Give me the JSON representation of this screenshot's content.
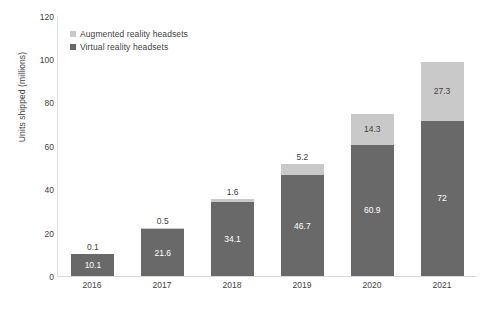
{
  "chart_data": {
    "type": "bar",
    "subtype": "stacked-column",
    "title": "",
    "subtitle": "",
    "xlabel": "",
    "ylabel": "Units shipped (millions)",
    "categories": [
      "2016",
      "2017",
      "2018",
      "2019",
      "2020",
      "2021"
    ],
    "series": [
      {
        "name": "Virtual reality headsets",
        "color": "#696969",
        "values": [
          10.1,
          21.6,
          34.1,
          46.7,
          60.9,
          72
        ],
        "labels": [
          "10.1",
          "21.6",
          "34.1",
          "46.7",
          "60.9",
          "72"
        ]
      },
      {
        "name": "Augmented reality headsets",
        "color": "#c9c9c9",
        "values": [
          0.1,
          0.5,
          1.6,
          5.2,
          14.3,
          27.3
        ],
        "labels": [
          "0.1",
          "0.5",
          "1.6",
          "5.2",
          "14.3",
          "27.3"
        ]
      }
    ],
    "ylim": [
      0,
      120
    ],
    "yticks": [
      0,
      20,
      40,
      60,
      80,
      100,
      120
    ],
    "ytick_labels": [
      "0",
      "20",
      "40",
      "60",
      "80",
      "100",
      "120"
    ],
    "grid": false,
    "legend_position": "top-left",
    "legend_order": [
      "Augmented reality headsets",
      "Virtual reality headsets"
    ]
  },
  "legend": {
    "items": [
      {
        "label": "Augmented reality headsets",
        "color": "#c9c9c9"
      },
      {
        "label": "Virtual reality headsets",
        "color": "#696969"
      }
    ]
  },
  "axes": {
    "y_title": "Units shipped (millions)",
    "y_ticks": [
      "120",
      "100",
      "80",
      "60",
      "40",
      "20",
      "0"
    ],
    "x_ticks": [
      "2016",
      "2017",
      "2018",
      "2019",
      "2020",
      "2021"
    ]
  }
}
